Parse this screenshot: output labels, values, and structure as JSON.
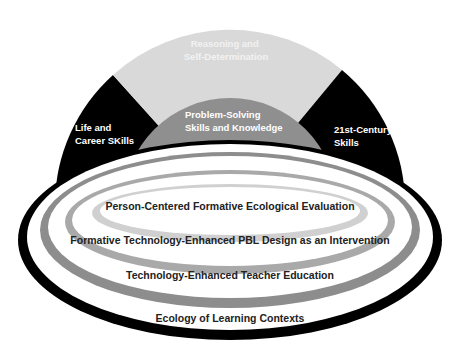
{
  "diagram": {
    "arch": {
      "top_segment": {
        "lines": [
          "Reasoning and",
          "Self-Determination"
        ],
        "color": "#d9d9d9"
      },
      "left_segment": {
        "lines": [
          "Life and",
          "Career SKills"
        ],
        "color": "#000000"
      },
      "right_segment": {
        "lines": [
          "21st-Century",
          "Skills"
        ],
        "color": "#000000"
      },
      "inner_arch": {
        "lines": [
          "Problem-Solving",
          "Skills and Knowledge"
        ],
        "color": "#8f8f8f"
      }
    },
    "rings": [
      {
        "label": "Person-Centered Formative Ecological Evaluation",
        "color": "#d0d0d0"
      },
      {
        "label": "Formative Technology-Enhanced PBL Design as an Intervention",
        "color": "#a9a9a9"
      },
      {
        "label": "Technology-Enhanced Teacher Education",
        "color": "#8d8d8d"
      },
      {
        "label": "Ecology of Learning Contexts",
        "color": "#000000"
      }
    ]
  }
}
